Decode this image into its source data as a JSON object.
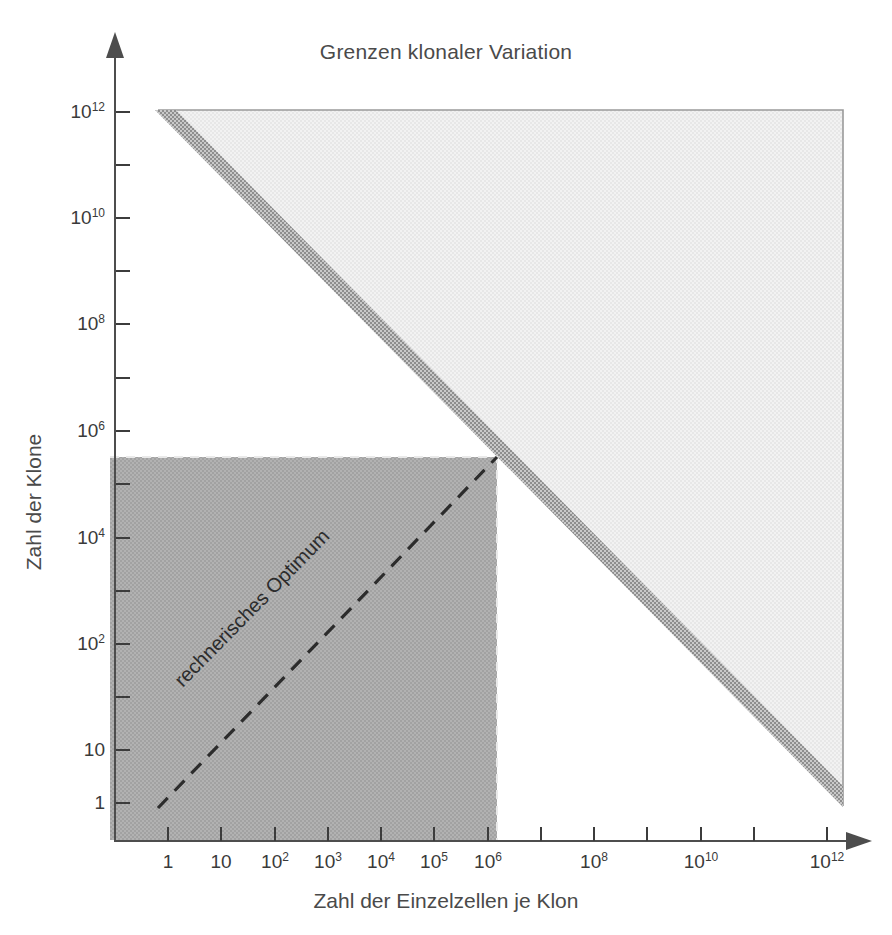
{
  "chart_data": {
    "type": "area",
    "title": "Grenzen klonaler Variation",
    "xlabel": "Zahl der Einzelzellen je Klon",
    "ylabel": "Zahl der Klone",
    "xscale": "log",
    "yscale": "log",
    "xlim": [
      1,
      1000000000000.0
    ],
    "ylim": [
      1,
      1000000000000.0
    ],
    "grid": false,
    "legend": "none",
    "x_tick_labels": [
      "1",
      "10",
      "10²",
      "10³",
      "10⁴",
      "10⁵",
      "10⁶",
      "10⁸",
      "10¹⁰",
      "10¹²"
    ],
    "x_tick_values": [
      1,
      10,
      100,
      1000,
      10000,
      100000,
      1000000,
      100000000,
      10000000000,
      1000000000000
    ],
    "y_tick_labels": [
      "10¹²",
      "10¹⁰",
      "10⁸",
      "10⁶",
      "10⁴",
      "10²",
      "10",
      "1"
    ],
    "y_tick_values": [
      1000000000000,
      10000000000,
      100000000,
      1000000,
      10000,
      100,
      10,
      1
    ],
    "regions": [
      {
        "name": "feasible-triangle",
        "description": "Light shaded region bounded by the constraint line x·y = 10¹²",
        "color": "#efefef",
        "vertices": [
          [
            1,
            1000000000000.0
          ],
          [
            1000000000000.0,
            1000000000000.0
          ],
          [
            1000000000000.0,
            1
          ]
        ]
      },
      {
        "name": "constraint-band",
        "description": "Dithered medium-grey band along the hyperbola boundary x·y = 10¹²",
        "color": "#a8a8a8",
        "line_from": [
          1,
          1000000000000.0
        ],
        "line_to": [
          1000000000000.0,
          1
        ]
      },
      {
        "name": "practical-range",
        "description": "Dark shaded rectangle of practically realised clone numbers / cells per clone",
        "color": "#a9a9a9",
        "x_range": [
          1,
          1000000
        ],
        "y_range": [
          1,
          300000
        ]
      }
    ],
    "annotations": [
      {
        "name": "rechnerisches-optimum",
        "text": "rechnerisches Optimum",
        "style": "dashed",
        "color": "#2c2c2c",
        "from": [
          1,
          1
        ],
        "to": [
          1000000,
          300000
        ]
      }
    ]
  },
  "ticks": {
    "x": [
      {
        "label": "1",
        "px": 168
      },
      {
        "label": "10",
        "px": 221
      },
      {
        "label": "10²",
        "px": 275
      },
      {
        "label": "10³",
        "px": 328
      },
      {
        "label": "10⁴",
        "px": 381
      },
      {
        "label": "10⁵",
        "px": 434
      },
      {
        "label": "10⁶",
        "px": 488
      },
      {
        "label": "",
        "px": 541
      },
      {
        "label": "10⁸",
        "px": 594
      },
      {
        "label": "",
        "px": 647
      },
      {
        "label": "10¹⁰",
        "px": 701
      },
      {
        "label": "",
        "px": 754
      },
      {
        "label": "10¹²",
        "px": 827
      }
    ],
    "y": [
      {
        "label": "10¹²",
        "px": 112
      },
      {
        "label": "",
        "px": 165
      },
      {
        "label": "10¹⁰",
        "px": 218
      },
      {
        "label": "",
        "px": 271
      },
      {
        "label": "10⁸",
        "px": 324
      },
      {
        "label": "",
        "px": 378
      },
      {
        "label": "10⁶",
        "px": 431
      },
      {
        "label": "",
        "px": 484
      },
      {
        "label": "10⁴",
        "px": 538
      },
      {
        "label": "",
        "px": 591
      },
      {
        "label": "10²",
        "px": 644
      },
      {
        "label": "",
        "px": 697
      },
      {
        "label": "10",
        "px": 750
      },
      {
        "label": "1",
        "px": 803
      }
    ]
  },
  "colors": {
    "light_region": "#efefef",
    "band": "#a8a8a8",
    "dark_region": "#a9a9a9",
    "axis": "#4d4d4d",
    "text": "#3a3a3a",
    "annotation": "#2c2c2c"
  }
}
